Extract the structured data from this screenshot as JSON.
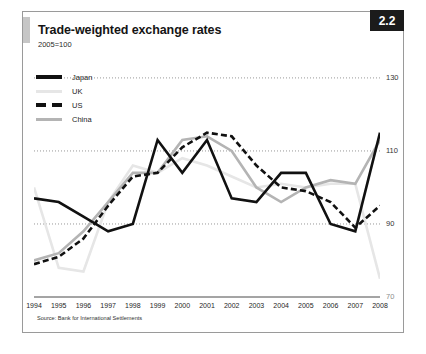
{
  "card": {
    "title": "Trade-weighted exchange rates",
    "subtitle": "2005=100",
    "badge": "2.2",
    "source": "Source: Bank for International Settlements"
  },
  "colors": {
    "japan": "#111111",
    "uk": "#e6e6e6",
    "us": "#111111",
    "china": "#b4b4b4",
    "gridline": "#8c8c8c",
    "badge_bg": "#1b1b1b",
    "frame": "#9a9a9a",
    "accent": "#c6c6c6"
  },
  "legend": {
    "items": [
      {
        "label": "Japan",
        "style": "solid-thick",
        "color": "#111111"
      },
      {
        "label": "UK",
        "style": "solid-thin",
        "color": "#e6e6e6"
      },
      {
        "label": "US",
        "style": "dashed",
        "color": "#111111"
      },
      {
        "label": "China",
        "style": "solid-thin",
        "color": "#b4b4b4"
      }
    ]
  },
  "chart_data": {
    "type": "line",
    "title": "Trade-weighted exchange rates",
    "subtitle": "2005=100",
    "xlabel": "",
    "ylabel": "",
    "ylim": [
      70,
      136
    ],
    "yticks": [
      130,
      110,
      90,
      70
    ],
    "ytick_labels": [
      "130",
      "110",
      "90",
      "70"
    ],
    "grid": "horizontal-dotted",
    "legend_position": "top-left",
    "x": [
      1994,
      1995,
      1996,
      1997,
      1998,
      1999,
      2000,
      2001,
      2002,
      2003,
      2004,
      2005,
      2006,
      2007,
      2008
    ],
    "series": [
      {
        "name": "Japan",
        "color": "#111111",
        "style": "solid",
        "width": 2.6,
        "values": [
          97,
          96,
          92,
          88,
          90,
          113,
          104,
          113,
          97,
          96,
          104,
          104,
          90,
          88,
          115
        ]
      },
      {
        "name": "UK",
        "color": "#e6e6e6",
        "style": "solid",
        "width": 2.6,
        "values": [
          100,
          78,
          77,
          96,
          106,
          104,
          108,
          106,
          103,
          100,
          101,
          100,
          101,
          101,
          75
        ]
      },
      {
        "name": "US",
        "color": "#111111",
        "style": "dashed",
        "width": 2.6,
        "values": [
          79,
          81,
          86,
          95,
          103,
          104,
          111,
          115,
          114,
          106,
          100,
          99,
          96,
          89,
          95
        ]
      },
      {
        "name": "China",
        "color": "#b4b4b4",
        "style": "solid",
        "width": 2.6,
        "values": [
          80,
          82,
          88,
          96,
          104,
          104,
          113,
          114,
          110,
          100,
          96,
          100,
          102,
          101,
          113
        ]
      }
    ]
  }
}
